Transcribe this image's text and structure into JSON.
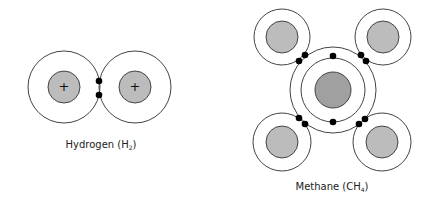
{
  "colors": {
    "background": "#ffffff",
    "stroke": "#444444",
    "hydrogen_nucleus": "#bcbcbc",
    "carbon_nucleus": "#a0a0a0",
    "electron": "#000000"
  },
  "hydrogen": {
    "label_main": "Hydrogen (H",
    "label_sub": "2",
    "label_close": ")",
    "atoms": [
      {
        "name": "H",
        "cx": 64,
        "cy": 87,
        "shell_r": 36,
        "nucleus_r": 16,
        "charge": "+"
      },
      {
        "name": "H",
        "cx": 135,
        "cy": 87,
        "shell_r": 36,
        "nucleus_r": 16,
        "charge": "+"
      }
    ],
    "electrons": [
      {
        "cx": 99,
        "cy": 81
      },
      {
        "cx": 99,
        "cy": 96
      }
    ]
  },
  "methane": {
    "label_main": "Methane (CH",
    "label_sub": "4",
    "label_close": ")",
    "carbon": {
      "cx": 333,
      "cy": 90,
      "nucleus_r": 18,
      "inner_shell_r": 32,
      "outer_shell_r": 43
    },
    "hydrogens": [
      {
        "position": "top-left",
        "cx": 282,
        "cy": 37,
        "shell_r": 28,
        "nucleus_r": 16
      },
      {
        "position": "top-right",
        "cx": 383,
        "cy": 37,
        "shell_r": 28,
        "nucleus_r": 16
      },
      {
        "position": "bottom-left",
        "cx": 282,
        "cy": 142,
        "shell_r": 29,
        "nucleus_r": 16
      },
      {
        "position": "bottom-right",
        "cx": 382,
        "cy": 142,
        "shell_r": 29,
        "nucleus_r": 16
      }
    ],
    "electrons": [
      {
        "cx": 333,
        "cy": 56
      },
      {
        "cx": 333,
        "cy": 122
      },
      {
        "cx": 299,
        "cy": 61
      },
      {
        "cx": 305,
        "cy": 55
      },
      {
        "cx": 361,
        "cy": 55
      },
      {
        "cx": 366,
        "cy": 61
      },
      {
        "cx": 299,
        "cy": 118
      },
      {
        "cx": 305,
        "cy": 124
      },
      {
        "cx": 359,
        "cy": 124
      },
      {
        "cx": 365,
        "cy": 119
      }
    ]
  }
}
